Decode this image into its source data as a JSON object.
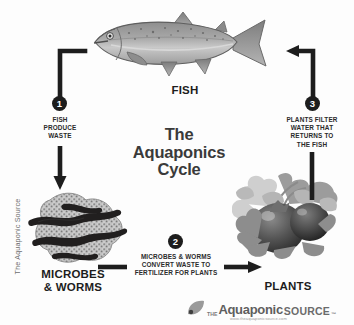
{
  "page": {
    "background_color": "#fdfdfd",
    "ink_color": "#1d1d1d",
    "side_credit": "The Aquaponic Source"
  },
  "title": {
    "line1": "The",
    "line2": "Aquaponics",
    "line3": "Cycle"
  },
  "nodes": {
    "fish": {
      "label": "FISH",
      "icon": "fish-illustration"
    },
    "microbes": {
      "label_line1": "MICROBES",
      "label_line2": "& WORMS",
      "icon": "worms-illustration"
    },
    "plants": {
      "label": "PLANTS",
      "icon": "tomato-plants-illustration"
    }
  },
  "steps": [
    {
      "number": "1",
      "line1": "FISH",
      "line2": "PRODUCE",
      "line3": "WASTE",
      "arrow": "arrow-down-left-elbow"
    },
    {
      "number": "2",
      "line1": "MICROBES & WORMS",
      "line2": "CONVERT WASTE TO",
      "line3": "FERTILIZER FOR PLANTS",
      "arrow": "arrow-right"
    },
    {
      "number": "3",
      "line1": "PLANTS FILTER",
      "line2": "WATER THAT",
      "line3": "RETURNS TO",
      "line4": "THE FISH",
      "arrow": "arrow-up-left-elbow"
    }
  ],
  "brand": {
    "the": "THE",
    "name": "Aquaponic",
    "source": "SOURCE",
    "trademark": "™",
    "url": "www.theaquaponicsource.com"
  }
}
